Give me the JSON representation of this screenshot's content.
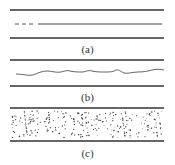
{
  "figure": {
    "panels": [
      {
        "id": "a",
        "label": "(a)",
        "description": "Flat interface with partial dashed line"
      },
      {
        "id": "b",
        "label": "(b)",
        "description": "Rough wavy interface"
      },
      {
        "id": "c",
        "label": "(c)",
        "description": "Dispersed particles layer"
      }
    ],
    "colors": {
      "line": "#333333",
      "dots": "#444444",
      "background": "#ffffff"
    }
  }
}
